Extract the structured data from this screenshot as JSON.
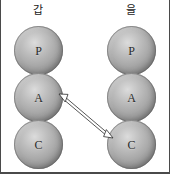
{
  "diagram": {
    "title": "",
    "columns": [
      {
        "id": "left",
        "label": "갑",
        "nodes": [
          {
            "id": "left-p",
            "label": "P"
          },
          {
            "id": "left-a",
            "label": "A"
          },
          {
            "id": "left-c",
            "label": "C"
          }
        ]
      },
      {
        "id": "right",
        "label": "을",
        "nodes": [
          {
            "id": "right-p",
            "label": "P"
          },
          {
            "id": "right-a",
            "label": "A"
          },
          {
            "id": "right-c",
            "label": "C"
          }
        ]
      }
    ],
    "connectors": [
      {
        "id": "a-to-c",
        "from": "left-a",
        "to": "right-c",
        "style": "double-headed-outline-arrow",
        "label": ""
      }
    ],
    "colors": {
      "sphere_highlight": "#dcdcdc",
      "sphere_midtone": "#a9a9a9",
      "sphere_shadow": "#7e7e7e",
      "sphere_outline": "#5f5f5f",
      "label_text": "#1a1a1a",
      "node_text": "#2a2a2a",
      "arrow_stroke": "#2b2b2b",
      "arrow_fill": "#ffffff",
      "frame_border": "#4a4a4a",
      "background": "#ffffff"
    }
  }
}
